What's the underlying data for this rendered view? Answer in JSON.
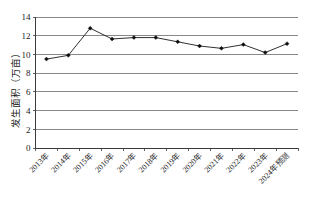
{
  "chart_data": {
    "type": "line",
    "title": "",
    "xlabel": "",
    "ylabel": "发生面积（万亩）",
    "ylim": [
      0,
      14
    ],
    "ytick_step": 2,
    "yticks": [
      "0",
      "2",
      "4",
      "6",
      "8",
      "10",
      "12",
      "14"
    ],
    "grid": true,
    "legend": "none",
    "marker": "diamond",
    "line_color": "#1a1a1a",
    "grid_color": "#6b6b6b",
    "categories": [
      "2013年",
      "2014年",
      "2015年",
      "2016年",
      "2017年",
      "2018年",
      "2019年",
      "2020年",
      "2021年",
      "2022年",
      "2023年",
      "2024年预测"
    ],
    "series": [
      {
        "name": "发生面积",
        "values": [
          9.5,
          9.9,
          12.8,
          11.65,
          11.8,
          11.8,
          11.35,
          10.9,
          10.65,
          11.05,
          10.2,
          11.15
        ]
      }
    ]
  }
}
